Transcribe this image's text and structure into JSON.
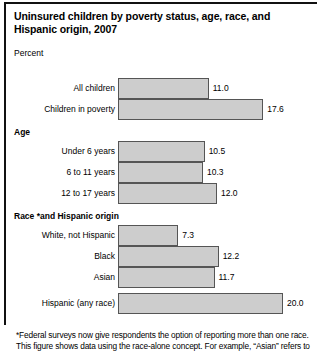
{
  "figure": {
    "title": "Uninsured children by poverty status, age, race, and Hispanic origin, 2007",
    "axis_unit": "Percent",
    "footnote": "*Federal surveys now give respondents the option of reporting more than one race. This figure shows data using the race-alone concept. For example, “Asian” refers to",
    "bar_fill_color": "#cdcdcd",
    "bar_border_color": "#555555",
    "rule_color": "#111111"
  },
  "chart_data": {
    "type": "bar",
    "orientation": "horizontal",
    "title": "Uninsured children by poverty status, age, race, and Hispanic origin, 2007",
    "xlabel": "Percent",
    "ylabel": "",
    "xlim": [
      0,
      20
    ],
    "grid": false,
    "legend": "none",
    "groups": [
      {
        "name": "",
        "heading": "",
        "items": [
          {
            "category": "All children",
            "value": 11.0,
            "label": "11.0"
          },
          {
            "category": "Children in poverty",
            "value": 17.6,
            "label": "17.6"
          }
        ]
      },
      {
        "name": "age",
        "heading": "Age",
        "items": [
          {
            "category": "Under 6 years",
            "value": 10.5,
            "label": "10.5"
          },
          {
            "category": "6 to 11 years",
            "value": 10.3,
            "label": "10.3"
          },
          {
            "category": "12 to 17 years",
            "value": 12.0,
            "label": "12.0"
          }
        ]
      },
      {
        "name": "race",
        "heading": "Race *and Hispanic origin",
        "items": [
          {
            "category": "White, not Hispanic",
            "value": 7.3,
            "label": "7.3"
          },
          {
            "category": "Black",
            "value": 12.2,
            "label": "12.2"
          },
          {
            "category": "Asian",
            "value": 11.7,
            "label": "11.7"
          }
        ]
      },
      {
        "name": "hispanic",
        "heading": "",
        "items": [
          {
            "category": "Hispanic (any race)",
            "value": 20.0,
            "label": "20.0"
          }
        ]
      }
    ],
    "categories": [
      "All children",
      "Children in poverty",
      "Under 6 years",
      "6 to 11 years",
      "12 to 17 years",
      "White, not Hispanic",
      "Black",
      "Asian",
      "Hispanic (any race)"
    ],
    "values": [
      11.0,
      17.6,
      10.5,
      10.3,
      12.0,
      7.3,
      12.2,
      11.7,
      20.0
    ]
  }
}
